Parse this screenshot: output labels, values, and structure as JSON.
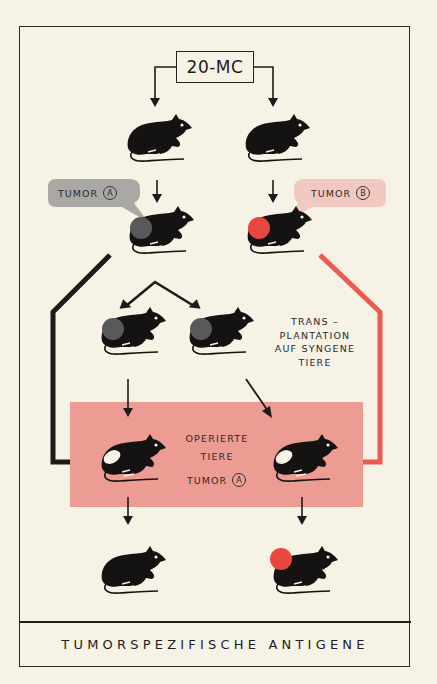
{
  "diagram": {
    "title": "TUMORSPEZIFISCHE ANTIGENE",
    "carcinogen_label": "20-MC",
    "tumor_labels": {
      "left": {
        "text": "TUMOR",
        "marker": "A",
        "bubble_color": "#a9a8a4"
      },
      "right": {
        "text": "TUMOR",
        "marker": "B",
        "bubble_color": "#f2c9c0"
      }
    },
    "transplant_note": [
      "TRANS –",
      "PLANTATION",
      "AUF SYNGENE",
      "TIERE"
    ],
    "operated_box": {
      "lines": [
        "OPERIERTE",
        "TIERE"
      ],
      "tumor_text": "TUMOR",
      "tumor_marker": "A",
      "color": "#ec9c93"
    },
    "colors": {
      "background": "#f6f2e6",
      "mouse": "#151212",
      "tumor_a": "#59595a",
      "tumor_b": "#e8473e",
      "red_path": "#ec5a50",
      "black_path": "#1b1b1b"
    },
    "nodes": [
      {
        "id": "mouse-1-left",
        "state": "healthy"
      },
      {
        "id": "mouse-1-right",
        "state": "healthy"
      },
      {
        "id": "mouse-2-left",
        "state": "tumor A"
      },
      {
        "id": "mouse-2-right",
        "state": "tumor B"
      },
      {
        "id": "mouse-3-left",
        "state": "tumor A transplanted"
      },
      {
        "id": "mouse-3-right",
        "state": "tumor A transplanted"
      },
      {
        "id": "mouse-4-left",
        "state": "operated"
      },
      {
        "id": "mouse-4-right",
        "state": "operated"
      },
      {
        "id": "mouse-5-left",
        "state": "no tumor"
      },
      {
        "id": "mouse-5-right",
        "state": "tumor growth"
      }
    ]
  }
}
